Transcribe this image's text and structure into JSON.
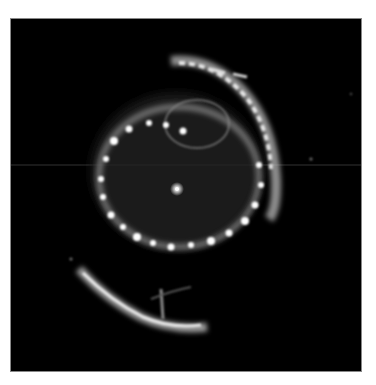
{
  "image": {
    "subject": "supernova remnant nebula",
    "background_color": "#000000",
    "page_background": "#ffffff",
    "glow_color": "#ffffff"
  }
}
